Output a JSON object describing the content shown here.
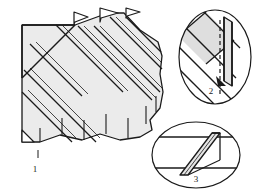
{
  "figure": {
    "type": "technical-line-drawing",
    "background_color": "#ffffff",
    "line_color": "#1a1a1a",
    "fill_color": "#ebebeb",
    "fill_color_dark": "#d8d8d8"
  },
  "labels": {
    "item_1": "1",
    "item_2": "2",
    "item_3": "3"
  },
  "main_view": {
    "name": "corrugated-panel-main-view",
    "description": "Ribbed panel with diagonal corrugations and scalloped right edge",
    "rib_count": 7,
    "flag_tab_count": 3
  },
  "detail_2": {
    "name": "detail-circle-2",
    "shape": "circle",
    "description": "Enlarged joint detail with vertical dashed centreline and upright plate"
  },
  "detail_3": {
    "name": "detail-ellipse-3",
    "shape": "ellipse",
    "description": "Enlarged seam detail with inclined plate between two parallel rails"
  }
}
